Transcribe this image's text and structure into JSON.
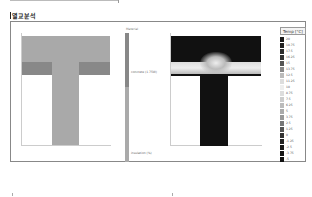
{
  "header": {
    "title": "열교분석"
  },
  "material_legend": {
    "title": "Material",
    "items": [
      {
        "label": "concrete (1.75W)",
        "color": "#888888"
      },
      {
        "label": "insulation (%)",
        "color": "#aaaaaa"
      }
    ]
  },
  "temperature_legend": {
    "title": "Temp [°C]",
    "items": [
      {
        "label": "20",
        "color": "#1a1a1a"
      },
      {
        "label": "18.75",
        "color": "#222222"
      },
      {
        "label": "17.5",
        "color": "#2b2b2b"
      },
      {
        "label": "16.25",
        "color": "#333333"
      },
      {
        "label": "15",
        "color": "#555555"
      },
      {
        "label": "13.75",
        "color": "#888888"
      },
      {
        "label": "12.5",
        "color": "#bbbbbb"
      },
      {
        "label": "11.25",
        "color": "#dddddd"
      },
      {
        "label": "10",
        "color": "#eeeeee"
      },
      {
        "label": "8.75",
        "color": "#dddddd"
      },
      {
        "label": "7.5",
        "color": "#cccccc"
      },
      {
        "label": "6.25",
        "color": "#bbbbbb"
      },
      {
        "label": "5",
        "color": "#aaaaaa"
      },
      {
        "label": "3.75",
        "color": "#999999"
      },
      {
        "label": "2.5",
        "color": "#777777"
      },
      {
        "label": "1.25",
        "color": "#555555"
      },
      {
        "label": "0",
        "color": "#333333"
      },
      {
        "label": "-1.25",
        "color": "#222222"
      },
      {
        "label": "-2.5",
        "color": "#1a1a1a"
      },
      {
        "label": "-3.75",
        "color": "#151515"
      },
      {
        "label": "-5",
        "color": "#111111"
      }
    ]
  }
}
